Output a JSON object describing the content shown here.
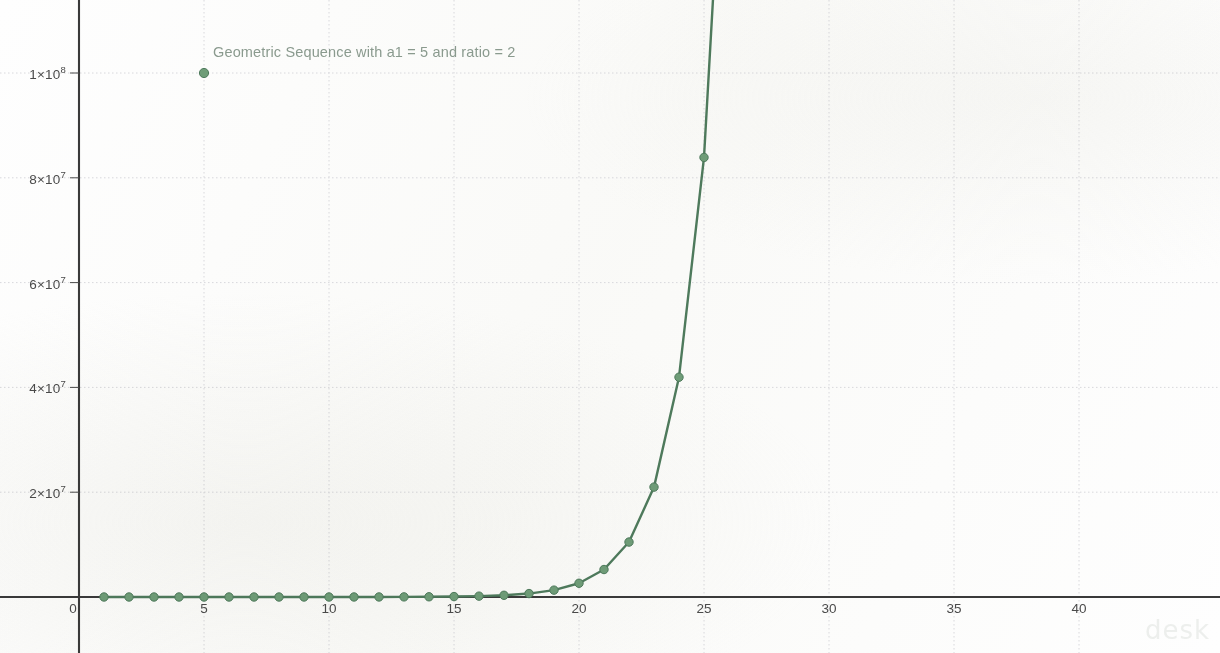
{
  "chart_data": {
    "type": "line",
    "title": "Geometric Sequence with a1 = 5 and ratio = 2",
    "xlabel": "",
    "ylabel": "",
    "grid": true,
    "legend_position": "top-center-inline",
    "series_name": "Geometric Sequence with a1 = 5 and ratio = 2",
    "legend_marker_point": {
      "x": 5,
      "y": 100000000
    },
    "xlim": [
      -1.5,
      43.5
    ],
    "ylim": [
      -6500000,
      108000000
    ],
    "xticks": [
      0,
      5,
      10,
      15,
      20,
      25,
      30,
      35,
      40
    ],
    "xtick_labels": [
      "0",
      "5",
      "10",
      "15",
      "20",
      "25",
      "30",
      "35",
      "40"
    ],
    "yticks": [
      20000000,
      40000000,
      60000000,
      80000000,
      100000000
    ],
    "ytick_labels": [
      "2×10⁷",
      "4×10⁷",
      "6×10⁷",
      "8×10⁷",
      "1×10⁸"
    ],
    "ytick_mantissas": [
      "2",
      "4",
      "6",
      "8",
      "1"
    ],
    "ytick_exponents": [
      "7",
      "7",
      "7",
      "7",
      "8"
    ],
    "formula": "a_n = 5 * 2^(n-1)",
    "a1": 5,
    "ratio": 2,
    "x": [
      1,
      2,
      3,
      4,
      5,
      6,
      7,
      8,
      9,
      10,
      11,
      12,
      13,
      14,
      15,
      16,
      17,
      18,
      19,
      20,
      21,
      22,
      23,
      24,
      25,
      26
    ],
    "values": [
      5,
      10,
      20,
      40,
      80,
      160,
      320,
      640,
      1280,
      2560,
      5120,
      10240,
      20480,
      40960,
      81920,
      163840,
      327680,
      655360,
      1310720,
      2621440,
      5242880,
      10485760,
      20971520,
      41943040,
      83886080,
      167772160
    ],
    "colors": {
      "line": "#4e7a5c",
      "marker": "#6f9d78",
      "marker_edge": "#4e7a5c",
      "title_text": "#8a9a8e",
      "axis": "#3a3a3a",
      "grid": "#d8d8dc",
      "tick_text": "#4a4a4a",
      "background": "#fefefe"
    }
  },
  "watermark": {
    "text": "desk"
  }
}
